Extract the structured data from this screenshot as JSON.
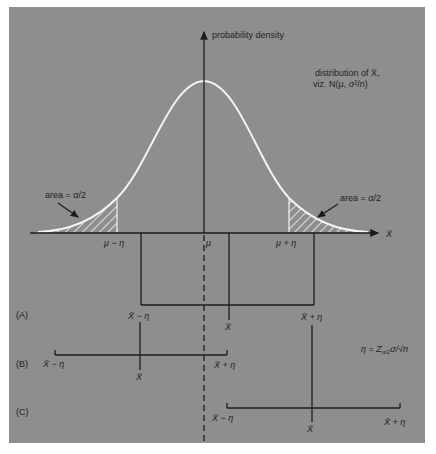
{
  "figure": {
    "background_color": "#8e8e8e",
    "curve_color": "#f4f4f4",
    "line_color": "#1c1c1c"
  },
  "axes": {
    "y_label": "probability density",
    "x_label": "X̄",
    "mean_label": "μ",
    "lower_label": "μ − η",
    "upper_label": "μ + η"
  },
  "annotations": {
    "distribution_line1": "distribution of X̄,",
    "distribution_line2": "viz. N(μ, σ²/n)",
    "left_area": "area = α/2",
    "right_area": "area = α/2",
    "eta_definition": "η = Z",
    "eta_subscript": "α/2",
    "eta_tail": "σ/√n"
  },
  "intervals": [
    {
      "row": "(A)",
      "lower": "X̄ − η",
      "center": "X̄",
      "upper": "X̄ + η"
    },
    {
      "row": "(B)",
      "lower": "X̄ − η",
      "center": "X̄",
      "upper": "X̄ + η"
    },
    {
      "row": "(C)",
      "lower": "X̄ − η",
      "center": "X̄",
      "upper": "X̄ + η"
    }
  ]
}
